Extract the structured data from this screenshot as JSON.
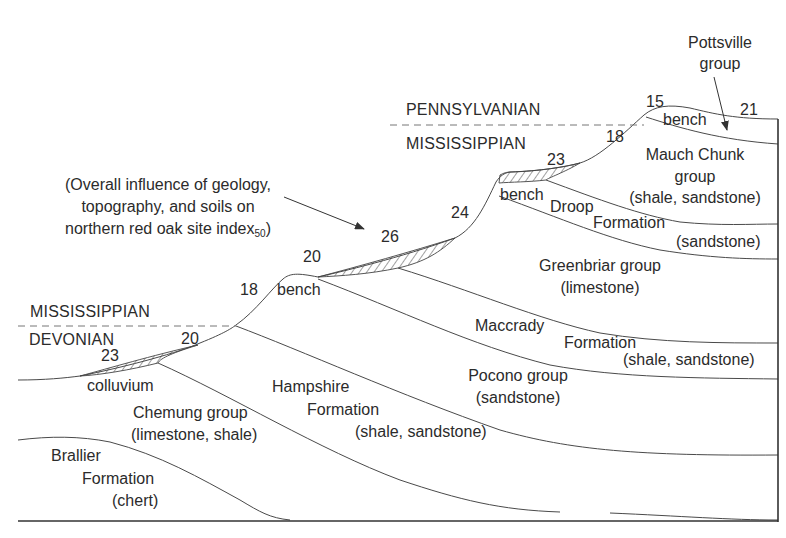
{
  "diagram": {
    "caption": {
      "line1": "(Overall influence of geology,",
      "line2": "topography, and soils on",
      "line3_prefix": "northern red oak site index",
      "line3_subscript": "50",
      "line3_suffix": ")"
    },
    "eras": {
      "pennsylvanian": "PENNSYLVANIAN",
      "mississippian_upper": "MISSISSIPPIAN",
      "mississippian_lower": "MISSISSIPPIAN",
      "devonian": "DEVONIAN"
    },
    "site_index_values": {
      "colluvium_lower": "23",
      "lower_slope": "20",
      "lower_steep": "18",
      "lower_bench": "20",
      "middle_hatch": "26",
      "middle_steep": "24",
      "upper_hatch": "23",
      "upper_steep": "18",
      "top_bench": "15",
      "top_right": "21"
    },
    "landform_labels": {
      "colluvium": "colluvium",
      "bench_lower": "bench",
      "bench_middle": "bench",
      "bench_top": "bench"
    },
    "formations": {
      "pottsville": {
        "line1": "Pottsville",
        "line2": "group"
      },
      "mauch_chunk": {
        "line1": "Mauch Chunk",
        "line2": "group",
        "line3": "(shale, sandstone)"
      },
      "droop": {
        "line1": "Droop",
        "line2": "Formation",
        "line3": "(sandstone)"
      },
      "greenbriar": {
        "line1": "Greenbriar group",
        "line2": "(limestone)"
      },
      "maccrady": {
        "line1": "Maccrady",
        "line2": "Formation",
        "line3": "(shale, sandstone)"
      },
      "pocono": {
        "line1": "Pocono group",
        "line2": "(sandstone)"
      },
      "hampshire": {
        "line1": "Hampshire",
        "line2": "Formation",
        "line3": "(shale, sandstone)"
      },
      "chemung": {
        "line1": "Chemung group",
        "line2": "(limestone, shale)"
      },
      "brallier": {
        "line1": "Brallier",
        "line2": "Formation",
        "line3": "(chert)"
      }
    }
  }
}
